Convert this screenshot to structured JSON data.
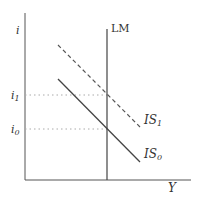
{
  "diagram": {
    "type": "IS-LM",
    "axes": {
      "y_label": "i",
      "x_label": "Y"
    },
    "curves": {
      "lm": {
        "label": "LM",
        "style": "solid vertical"
      },
      "is0": {
        "label_main": "IS",
        "label_sub": "0",
        "style": "solid"
      },
      "is1": {
        "label_main": "IS",
        "label_sub": "1",
        "style": "dashed"
      }
    },
    "levels": {
      "i1": {
        "main": "i",
        "sub": "1"
      },
      "i0": {
        "main": "i",
        "sub": "0"
      }
    },
    "colors": {
      "line": "#444444",
      "guide": "#aaaaaa",
      "background": "#ffffff"
    }
  }
}
